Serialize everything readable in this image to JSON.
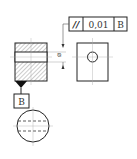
{
  "diagram": {
    "type": "gdt-parallelism",
    "feature_control_frame": {
      "symbol": "//",
      "symbol_name": "parallelism",
      "tolerance": "0,01",
      "datum": "B"
    },
    "datum_label": "B",
    "dimension_symbol": "⌀",
    "colors": {
      "line": "#222222",
      "hatch": "#888888",
      "center": "#999999"
    }
  }
}
